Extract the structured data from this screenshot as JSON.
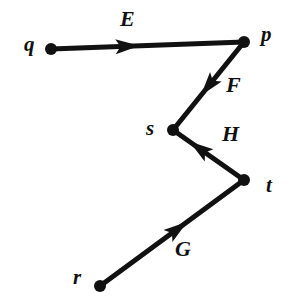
{
  "diagram": {
    "type": "directed-graph",
    "title": "",
    "background_color": "#ffffff",
    "ink_color": "#111111",
    "canvas": {
      "width": 295,
      "height": 307
    },
    "nodes": [
      {
        "id": "q",
        "label": "q",
        "x": 51,
        "y": 49,
        "radius": 6,
        "label_x": 24,
        "label_y": 34
      },
      {
        "id": "p",
        "label": "p",
        "x": 244,
        "y": 42,
        "radius": 6,
        "label_x": 261,
        "label_y": 24
      },
      {
        "id": "s",
        "label": "s",
        "x": 173,
        "y": 130,
        "radius": 6,
        "label_x": 146,
        "label_y": 118
      },
      {
        "id": "t",
        "label": "t",
        "x": 244,
        "y": 180,
        "radius": 6,
        "label_x": 266,
        "label_y": 175
      },
      {
        "id": "r",
        "label": "r",
        "x": 100,
        "y": 286,
        "radius": 6,
        "label_x": 73,
        "label_y": 267
      }
    ],
    "edges": [
      {
        "id": "E",
        "label": "E",
        "from": "q",
        "to": "p",
        "directed": true,
        "x1": 51,
        "y1": 49,
        "x2": 244,
        "y2": 42,
        "arrow_t": 0.36,
        "label_x": 120,
        "label_y": 8
      },
      {
        "id": "F",
        "label": "F",
        "from": "p",
        "to": "s",
        "directed": true,
        "x1": 244,
        "y1": 42,
        "x2": 173,
        "y2": 130,
        "arrow_t": 0.44,
        "label_x": 226,
        "label_y": 74
      },
      {
        "id": "H",
        "label": "H",
        "from": "t",
        "to": "s",
        "directed": true,
        "x1": 244,
        "y1": 180,
        "x2": 173,
        "y2": 130,
        "arrow_t": 0.55,
        "label_x": 222,
        "label_y": 123
      },
      {
        "id": "G",
        "label": "G",
        "from": "r",
        "to": "t",
        "directed": true,
        "x1": 100,
        "y1": 286,
        "x2": 244,
        "y2": 180,
        "arrow_t": 0.5,
        "label_x": 175,
        "label_y": 238
      }
    ]
  }
}
